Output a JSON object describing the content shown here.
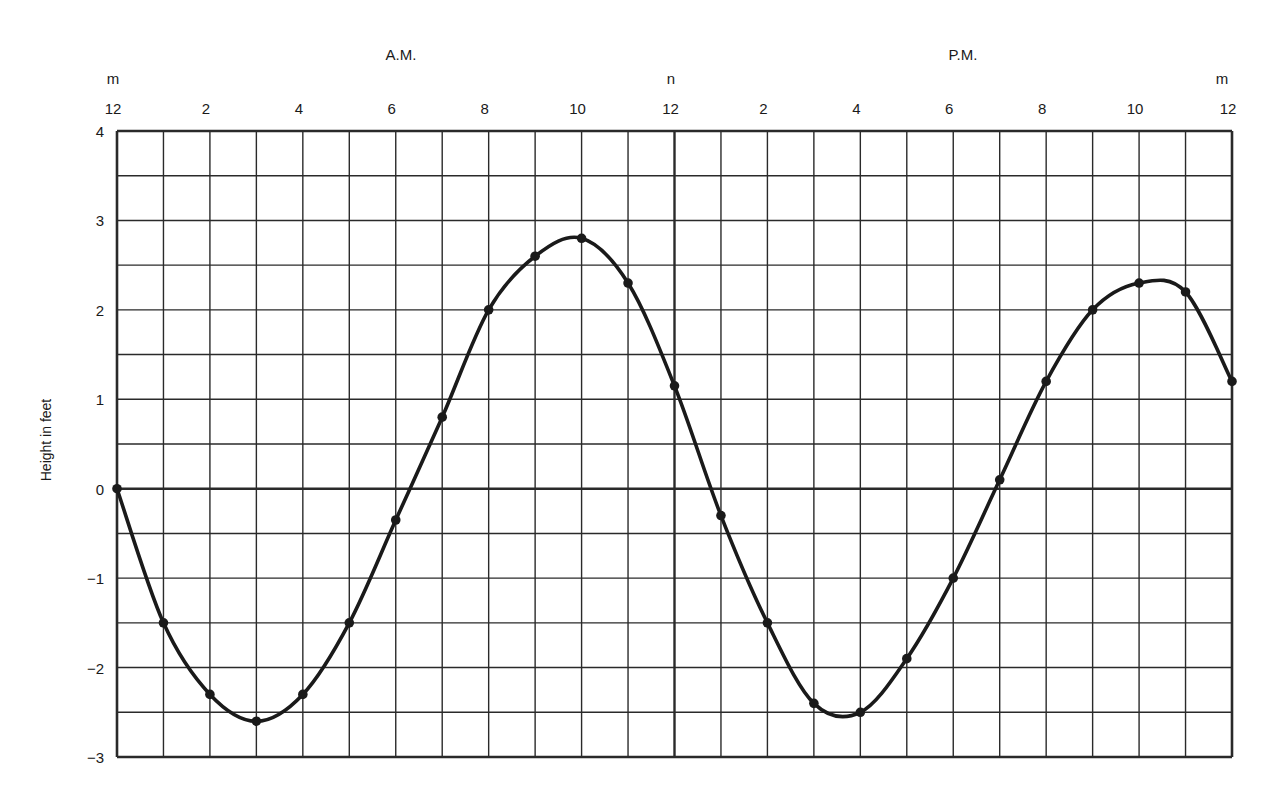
{
  "chart_data": {
    "type": "line",
    "title": "",
    "xlabel": "",
    "ylabel": "Height in feet",
    "period_labels": [
      "A.M.",
      "P.M."
    ],
    "top_marker_labels": [
      {
        "hour": 0,
        "text": "m"
      },
      {
        "hour": 12,
        "text": "n"
      },
      {
        "hour": 24,
        "text": "m"
      }
    ],
    "x_tick_labels": [
      {
        "hour": 0,
        "text": "12"
      },
      {
        "hour": 2,
        "text": "2"
      },
      {
        "hour": 4,
        "text": "4"
      },
      {
        "hour": 6,
        "text": "6"
      },
      {
        "hour": 8,
        "text": "8"
      },
      {
        "hour": 10,
        "text": "10"
      },
      {
        "hour": 12,
        "text": "12"
      },
      {
        "hour": 14,
        "text": "2"
      },
      {
        "hour": 16,
        "text": "4"
      },
      {
        "hour": 18,
        "text": "6"
      },
      {
        "hour": 20,
        "text": "8"
      },
      {
        "hour": 22,
        "text": "10"
      },
      {
        "hour": 24,
        "text": "12"
      }
    ],
    "y_ticks": [
      4,
      3,
      2,
      1,
      0,
      -1,
      -2,
      -3
    ],
    "y_tick_labels": [
      "4",
      "3",
      "2",
      "1",
      "0",
      "−1",
      "−2",
      "−3"
    ],
    "xlim": [
      0,
      24
    ],
    "ylim": [
      -3,
      4
    ],
    "grid": {
      "x_step_hours": 1,
      "y_step_feet": 0.5,
      "emphasized_x": [
        12
      ],
      "emphasized_y": [
        0
      ]
    },
    "series": [
      {
        "name": "Tide height",
        "x": [
          0,
          1,
          2,
          3,
          4,
          5,
          6,
          7,
          8,
          9,
          10,
          11,
          12,
          13,
          14,
          15,
          16,
          17,
          18,
          19,
          20,
          21,
          22,
          23,
          24
        ],
        "values": [
          0.0,
          -1.5,
          -2.3,
          -2.6,
          -2.3,
          -1.5,
          -0.35,
          0.8,
          2.0,
          2.6,
          2.8,
          2.3,
          1.15,
          -0.3,
          -1.5,
          -2.4,
          -2.5,
          -1.9,
          -1.0,
          0.1,
          1.2,
          2.0,
          2.3,
          2.2,
          1.2
        ],
        "color": "#1a1a1a"
      }
    ]
  },
  "colors": {
    "ink": "#1a1a1a",
    "grid": "#2a2a2a",
    "paper": "#ffffff"
  }
}
